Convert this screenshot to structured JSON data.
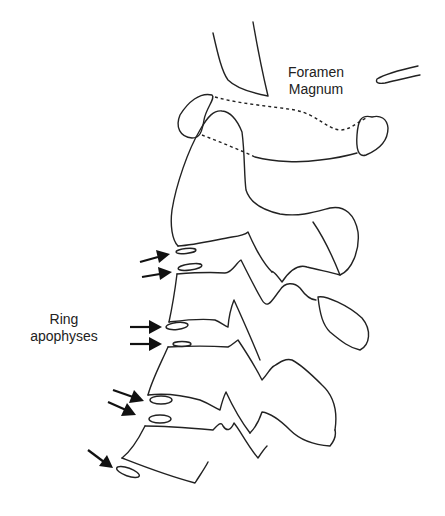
{
  "figure": {
    "type": "anatomical line drawing",
    "colors": {
      "line": "#222222",
      "background": "#ffffff"
    }
  },
  "labels": {
    "foramen_magnum": {
      "line1": "Foramen",
      "line2": "Magnum"
    },
    "ring_apophyses": {
      "line1": "Ring",
      "line2": "apophyses"
    }
  },
  "arrows": {
    "count": 7,
    "groups": [
      {
        "name": "upper-pair",
        "count": 2
      },
      {
        "name": "middle-pair",
        "count": 2
      },
      {
        "name": "lower-pair",
        "count": 2
      },
      {
        "name": "bottom-single",
        "count": 1
      }
    ]
  }
}
